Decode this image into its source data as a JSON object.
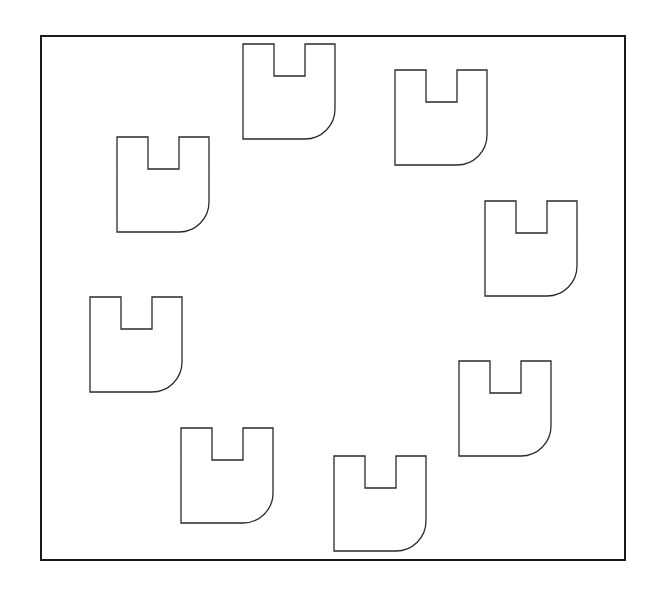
{
  "diagram": {
    "background": "#ffffff",
    "stroke_color": "#2a2a2a",
    "frame": {
      "x": 41,
      "y": 36,
      "width": 584,
      "height": 524,
      "stroke_width": 2
    },
    "shape_template": {
      "description": "U-shaped outline with top notch and rounded bottom-right corner",
      "width": 92,
      "height": 95,
      "notch_left": 31,
      "notch_width": 31,
      "notch_depth": 32,
      "corner_radius": 30
    },
    "shapes": [
      {
        "id": "u-shape-1",
        "x": 243,
        "y": 44
      },
      {
        "id": "u-shape-2",
        "x": 395,
        "y": 70
      },
      {
        "id": "u-shape-3",
        "x": 485,
        "y": 201
      },
      {
        "id": "u-shape-4",
        "x": 459,
        "y": 361
      },
      {
        "id": "u-shape-5",
        "x": 334,
        "y": 456
      },
      {
        "id": "u-shape-6",
        "x": 181,
        "y": 428
      },
      {
        "id": "u-shape-7",
        "x": 90,
        "y": 297
      },
      {
        "id": "u-shape-8",
        "x": 117,
        "y": 137
      }
    ]
  }
}
